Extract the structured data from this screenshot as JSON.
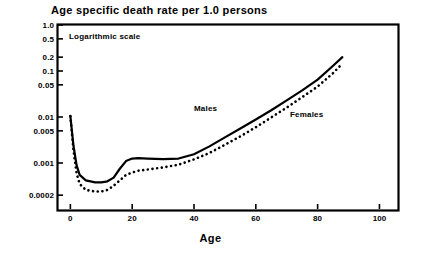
{
  "chart_data": {
    "type": "line",
    "title": "Age specific death rate per 1.0 persons",
    "xlabel": "Age",
    "ylabel": "",
    "annotation": "Logarithmic scale",
    "yscale": "log",
    "xlim": [
      -4,
      106
    ],
    "ylim": [
      0.0001,
      1.0
    ],
    "grid": false,
    "legend_position": "inline-on-curve",
    "y_ticks": [
      {
        "label": "1.0",
        "value": 1.0
      },
      {
        "label": "0.5",
        "value": 0.5
      },
      {
        "label": "0.2",
        "value": 0.2
      },
      {
        "label": "0.1",
        "value": 0.1
      },
      {
        "label": "0.05",
        "value": 0.05
      },
      {
        "label": "0.01",
        "value": 0.01
      },
      {
        "label": "0.005",
        "value": 0.005
      },
      {
        "label": "0.001",
        "value": 0.001
      },
      {
        "label": "0.0002",
        "value": 0.0002
      }
    ],
    "x_ticks": [
      {
        "label": "0",
        "value": 0
      },
      {
        "label": "20",
        "value": 20
      },
      {
        "label": "40",
        "value": 40
      },
      {
        "label": "60",
        "value": 60
      },
      {
        "label": "80",
        "value": 80
      },
      {
        "label": "100",
        "value": 100
      }
    ],
    "series": [
      {
        "name": "Males",
        "style": "solid",
        "color": "#000000",
        "x": [
          0,
          1,
          2,
          3,
          5,
          8,
          10,
          12,
          14,
          16,
          18,
          20,
          22,
          25,
          30,
          35,
          40,
          45,
          50,
          55,
          60,
          65,
          70,
          75,
          80,
          85,
          88
        ],
        "y": [
          0.0105,
          0.0024,
          0.0009,
          0.00055,
          0.00042,
          0.00038,
          0.00038,
          0.0004,
          0.00048,
          0.00075,
          0.0011,
          0.00125,
          0.00128,
          0.00125,
          0.00122,
          0.00125,
          0.00155,
          0.0023,
          0.0036,
          0.0056,
          0.0088,
          0.014,
          0.023,
          0.038,
          0.065,
          0.13,
          0.2
        ]
      },
      {
        "name": "Females",
        "style": "dotted",
        "color": "#000000",
        "x": [
          0,
          1,
          2,
          3,
          5,
          8,
          10,
          12,
          14,
          16,
          18,
          20,
          22,
          25,
          30,
          35,
          40,
          45,
          50,
          55,
          60,
          65,
          70,
          75,
          80,
          85,
          88
        ],
        "y": [
          0.0105,
          0.0019,
          0.0006,
          0.00035,
          0.00026,
          0.00024,
          0.00024,
          0.00026,
          0.00032,
          0.00042,
          0.00055,
          0.00062,
          0.00068,
          0.00072,
          0.0008,
          0.00092,
          0.0012,
          0.00165,
          0.0025,
          0.0038,
          0.006,
          0.0098,
          0.016,
          0.027,
          0.046,
          0.09,
          0.145
        ]
      }
    ]
  }
}
